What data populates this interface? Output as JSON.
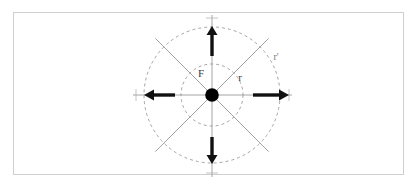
{
  "figure": {
    "background_color": "#ffffff",
    "frame": {
      "color": "#cfcfcf",
      "x": 13,
      "y": 12,
      "width": 391,
      "height": 163
    },
    "center_point": {
      "label": "",
      "color": "#000000",
      "cx": 212,
      "cy": 95,
      "r": 6.5
    },
    "labels": {
      "force": "F",
      "radius_inner": "r",
      "radius_outer": "r'"
    },
    "label_positions": {
      "force": {
        "x": 201,
        "y": 77
      },
      "radius_inner": {
        "x": 240,
        "y": 81
      },
      "radius_outer": {
        "x": 274,
        "y": 60
      }
    },
    "circles": [
      {
        "name": "inner-radius-circle",
        "radius": 31,
        "stroke": "#9a9a9a",
        "dash": "3 3"
      },
      {
        "name": "outer-radius-circle",
        "radius": 68,
        "stroke": "#9a9a9a",
        "dash": "3 3"
      }
    ],
    "axes": {
      "color": "#9a9a9a",
      "horizontal": {
        "x1": 133,
        "x2": 292,
        "y": 95
      },
      "vertical": {
        "y1": 15,
        "y2": 177,
        "x": 212
      }
    },
    "diagonals": {
      "color": "#8a8a8a",
      "count": 4,
      "angles_deg": [
        45,
        135,
        225,
        315
      ],
      "length": 80
    },
    "arrows": {
      "color": "#111111",
      "count": 4,
      "vectors": [
        {
          "name": "arrow-right",
          "direction": "right",
          "tail_x": 253,
          "tail_y": 95,
          "tip_x": 287,
          "tip_y": 95
        },
        {
          "name": "arrow-left",
          "direction": "left",
          "tail_x": 176,
          "tail_y": 95,
          "tip_x": 145,
          "tip_y": 95
        },
        {
          "name": "arrow-up",
          "direction": "up",
          "tail_x": 212,
          "tail_y": 55,
          "tip_x": 212,
          "tip_y": 27
        },
        {
          "name": "arrow-down",
          "direction": "down",
          "tail_x": 212,
          "tail_y": 137,
          "tip_x": 212,
          "tip_y": 163
        }
      ]
    },
    "tick_marks": {
      "color": "#b5b5b5",
      "positions": [
        {
          "x": 136,
          "y": 95
        },
        {
          "x": 289,
          "y": 95
        },
        {
          "x": 212,
          "y": 18
        },
        {
          "x": 212,
          "y": 173
        }
      ]
    }
  }
}
